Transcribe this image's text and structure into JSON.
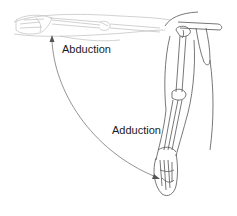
{
  "diagram": {
    "labels": {
      "abduction": "Abduction",
      "adduction": "Adduction"
    },
    "elements": [
      {
        "name": "abducted-arm",
        "description": "Faint horizontal arm raised to shoulder level"
      },
      {
        "name": "shoulder-girdle",
        "description": "Scapula and clavicle at upper right"
      },
      {
        "name": "adducted-arm",
        "description": "Arm hanging vertically at side, bones visible"
      },
      {
        "name": "motion-arrow",
        "description": "Curved double-headed arrow between positions"
      }
    ],
    "colors": {
      "line": "#555555",
      "faint_line": "#bdbdbd",
      "arrow": "#777777",
      "text": "#1a1a1a",
      "background": "#ffffff"
    }
  }
}
